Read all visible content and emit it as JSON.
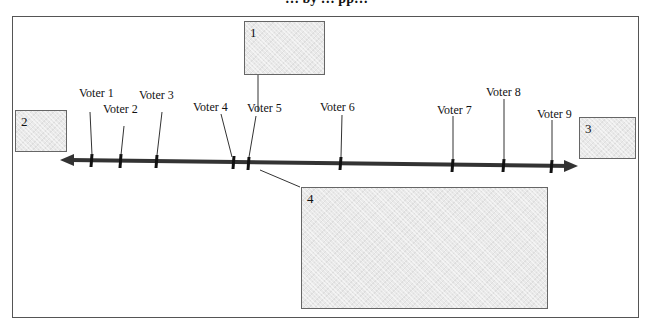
{
  "title_cropped": "… by … pp…",
  "boxes": {
    "box1": "1",
    "box2": "2",
    "box3": "3",
    "box4": "4"
  },
  "voters": [
    {
      "label": "Voter 1",
      "x": 92
    },
    {
      "label": "Voter 2",
      "x": 121
    },
    {
      "label": "Voter 3",
      "x": 157
    },
    {
      "label": "Voter 4",
      "x": 234
    },
    {
      "label": "Voter 5",
      "x": 249
    },
    {
      "label": "Voter 6",
      "x": 341
    },
    {
      "label": "Voter 7",
      "x": 453
    },
    {
      "label": "Voter 8",
      "x": 504
    },
    {
      "label": "Voter 9",
      "x": 552
    }
  ]
}
